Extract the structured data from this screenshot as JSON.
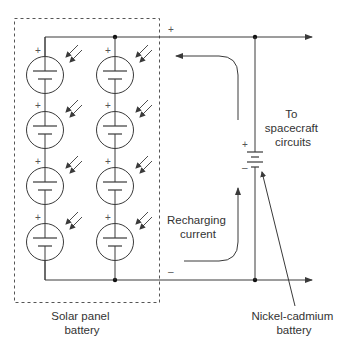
{
  "diagram": {
    "colors": {
      "line": "#3a3a3a",
      "dashed_box": "#555555",
      "text": "#333333",
      "background": "#ffffff"
    },
    "labels": {
      "solar_panel": [
        "Solar panel",
        "battery"
      ],
      "spacecraft": [
        "To",
        "spacecraft",
        "circuits"
      ],
      "recharging": [
        "Recharging",
        "current"
      ],
      "nicad": [
        "Nickel-cadmium",
        "battery"
      ]
    },
    "signs": {
      "top_rail_plus": "+",
      "bottom_rail_minus": "–",
      "battery_plus": "+",
      "battery_minus": "–",
      "cell_plus": "+"
    },
    "solar_array": {
      "columns": 2,
      "cells_per_column": 4,
      "cell_symbol": "photovoltaic-cell",
      "light_indicator": "double-arrow-incident-light"
    },
    "components": [
      {
        "id": "solar-panel-battery",
        "type": "solar cell array",
        "count": 8
      },
      {
        "id": "nickel-cadmium-battery",
        "type": "battery"
      },
      {
        "id": "spacecraft-circuits",
        "type": "load"
      }
    ]
  }
}
